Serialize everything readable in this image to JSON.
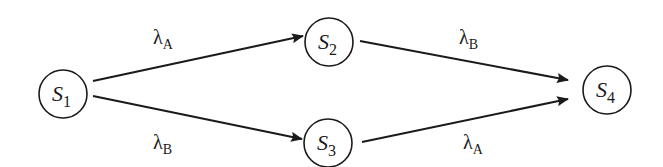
{
  "diagram": {
    "type": "state-transition",
    "nodes": [
      {
        "id": "S1",
        "base": "S",
        "sub": "1",
        "cx": 63,
        "cy": 94
      },
      {
        "id": "S2",
        "base": "S",
        "sub": "2",
        "cx": 329,
        "cy": 42
      },
      {
        "id": "S3",
        "base": "S",
        "sub": "3",
        "cx": 328,
        "cy": 143
      },
      {
        "id": "S4",
        "base": "S",
        "sub": "4",
        "cx": 607,
        "cy": 90
      }
    ],
    "edges": [
      {
        "from": "S1",
        "to": "S2",
        "symbol": "λ",
        "sub": "A"
      },
      {
        "from": "S1",
        "to": "S3",
        "symbol": "λ",
        "sub": "B"
      },
      {
        "from": "S2",
        "to": "S4",
        "symbol": "λ",
        "sub": "B"
      },
      {
        "from": "S3",
        "to": "S4",
        "symbol": "λ",
        "sub": "A"
      }
    ]
  }
}
